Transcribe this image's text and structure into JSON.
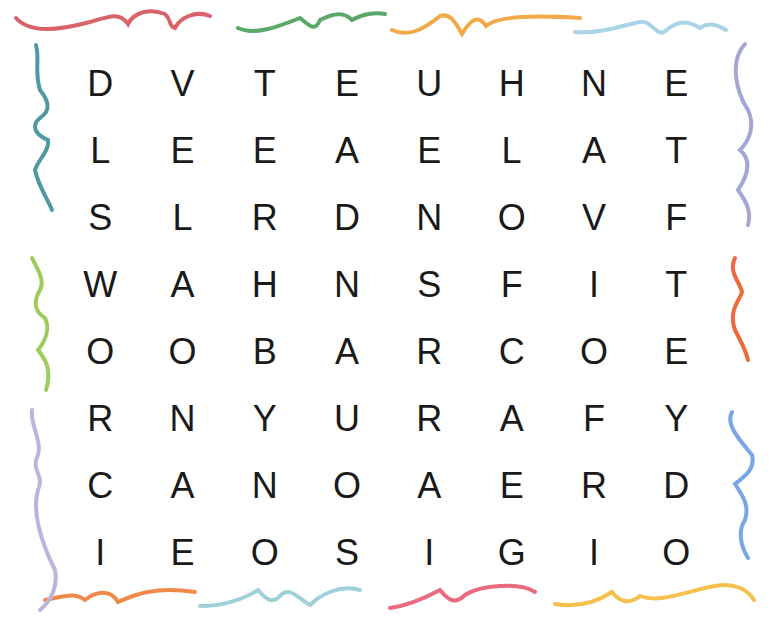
{
  "puzzle": {
    "type": "word-search",
    "rows": 8,
    "cols": 8,
    "grid": [
      [
        "D",
        "V",
        "T",
        "E",
        "U",
        "H",
        "N",
        "E"
      ],
      [
        "L",
        "E",
        "E",
        "A",
        "E",
        "L",
        "A",
        "T"
      ],
      [
        "S",
        "L",
        "R",
        "D",
        "N",
        "O",
        "V",
        "F"
      ],
      [
        "W",
        "A",
        "H",
        "N",
        "S",
        "F",
        "I",
        "T"
      ],
      [
        "O",
        "O",
        "B",
        "A",
        "R",
        "C",
        "O",
        "E"
      ],
      [
        "R",
        "N",
        "Y",
        "U",
        "R",
        "A",
        "F",
        "Y"
      ],
      [
        "C",
        "A",
        "N",
        "O",
        "A",
        "E",
        "R",
        "D"
      ],
      [
        "I",
        "E",
        "O",
        "S",
        "I",
        "G",
        "I",
        "O"
      ]
    ]
  },
  "border": {
    "style": "hand-drawn wavy crayon strokes",
    "colors": {
      "top": [
        "#d9636a",
        "#5aa86a",
        "#f2a94a",
        "#a8d4e6"
      ],
      "right": [
        "#a4a6d6",
        "#ec6a3c",
        "#7aa6e6"
      ],
      "bottom": [
        "#ef8a4a",
        "#9fd0da",
        "#ea6a80",
        "#f5c04e"
      ],
      "left": [
        "#4e9aa0",
        "#9ccc5a",
        "#bdb4dc"
      ]
    }
  }
}
